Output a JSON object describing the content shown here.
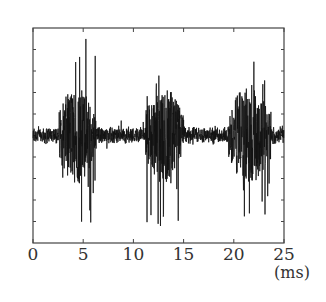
{
  "chart_data": {
    "type": "line",
    "title": "",
    "xlabel": "",
    "x_unit": "(ms)",
    "ylabel": "",
    "xlim": [
      0,
      25
    ],
    "x_ticks": [
      0,
      5,
      10,
      15,
      20,
      25
    ],
    "x_tick_labels": [
      "0",
      "5",
      "10",
      "15",
      "20",
      "25"
    ],
    "y_ticks_labeled": false,
    "y_tick_count": 10,
    "grid": false,
    "legend": null,
    "series": [
      {
        "name": "signal waveform",
        "description": "Noisy oscillating signal with a low-amplitude baseline and three high-amplitude bursts",
        "baseline_amplitude": 0.08,
        "bursts": [
          {
            "start_ms": 2.6,
            "end_ms": 6.3,
            "peak_positive": 1.0,
            "peak_negative": -0.9
          },
          {
            "start_ms": 11.2,
            "end_ms": 15.0,
            "peak_positive": 0.78,
            "peak_negative": -0.9
          },
          {
            "start_ms": 19.5,
            "end_ms": 23.7,
            "peak_positive": 0.78,
            "peak_negative": -0.8
          }
        ]
      }
    ],
    "colors": {
      "signal": "#111111",
      "axis": "#444444",
      "background": "#ffffff"
    }
  }
}
